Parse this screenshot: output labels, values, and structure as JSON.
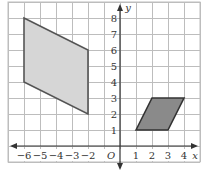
{
  "diagram": {
    "type": "coordinate-grid",
    "axes": {
      "x_label": "x",
      "y_label": "y",
      "origin_label": "O",
      "x_ticks": [
        "−6",
        "−5",
        "−4",
        "−3",
        "−2",
        "1",
        "2",
        "3",
        "4"
      ],
      "x_tick_values": [
        -6,
        -5,
        -4,
        -3,
        -2,
        1,
        2,
        3,
        4
      ],
      "y_ticks": [
        "1",
        "2",
        "3",
        "4",
        "5",
        "6",
        "7",
        "8"
      ],
      "y_tick_values": [
        1,
        2,
        3,
        4,
        5,
        6,
        7,
        8
      ],
      "x_range": [
        -7,
        5
      ],
      "y_range": [
        -1,
        9
      ]
    },
    "shapes": [
      {
        "name": "large-parallelogram",
        "vertices": [
          [
            -6,
            8
          ],
          [
            -2,
            6
          ],
          [
            -2,
            2
          ],
          [
            -6,
            4
          ]
        ],
        "fill": "#d6d6d6",
        "stroke": "#555555"
      },
      {
        "name": "small-parallelogram",
        "vertices": [
          [
            1,
            1
          ],
          [
            2,
            3
          ],
          [
            4,
            3
          ],
          [
            3,
            1
          ]
        ],
        "fill": "#8a8a8a",
        "stroke": "#333333"
      }
    ],
    "colors": {
      "grid": "#bdbdbd",
      "axis": "#333333",
      "label": "#333333"
    }
  }
}
